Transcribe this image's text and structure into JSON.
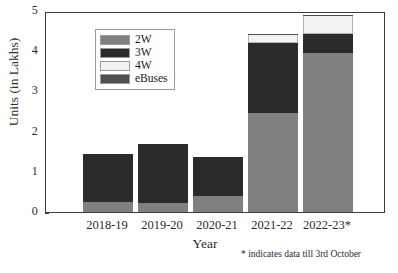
{
  "chart_data": {
    "type": "bar",
    "subtype": "stacked",
    "title": "",
    "xlabel": "Year",
    "ylabel": "Units (in Lakhs)",
    "categories": [
      "2018-19",
      "2019-20",
      "2020-21",
      "2021-22",
      "2022-23*"
    ],
    "series": [
      {
        "name": "2W",
        "color": "#808080",
        "values": [
          0.25,
          0.22,
          0.4,
          2.47,
          3.95
        ]
      },
      {
        "name": "3W",
        "color": "#2b2b2b",
        "values": [
          1.2,
          1.48,
          0.98,
          1.73,
          0.47
        ]
      },
      {
        "name": "4W",
        "color": "#f2f2f2",
        "values": [
          0.0,
          0.0,
          0.0,
          0.22,
          0.47
        ]
      },
      {
        "name": "eBuses",
        "color": "#4f4f4f",
        "values": [
          0.0,
          0.0,
          0.0,
          0.02,
          0.01
        ]
      }
    ],
    "totals": [
      1.45,
      1.7,
      1.38,
      4.44,
      4.9
    ],
    "ylim": [
      0,
      5
    ],
    "yticks": [
      0,
      1,
      2,
      3,
      4,
      5
    ],
    "ytick_labels": [
      "0",
      "1",
      "2",
      "3",
      "4",
      "5"
    ],
    "grid": false,
    "legend_position": "upper-left",
    "annotation": "* indicates data till 3rd October"
  },
  "legend": {
    "items": [
      {
        "label": "2W",
        "color": "#808080"
      },
      {
        "label": "3W",
        "color": "#2b2b2b"
      },
      {
        "label": "4W",
        "color": "#f2f2f2"
      },
      {
        "label": "eBuses",
        "color": "#4f4f4f"
      }
    ]
  }
}
